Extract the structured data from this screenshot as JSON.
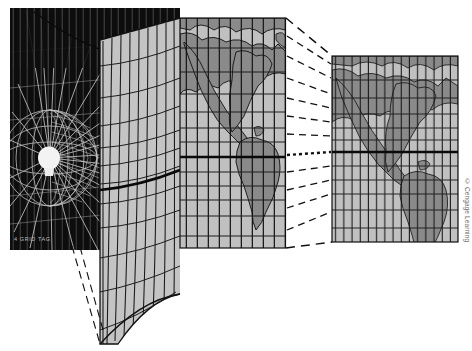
{
  "figure": {
    "credit": "© Cengage Learning",
    "globe_label": "4 GRID TAG",
    "colors": {
      "paper": "#ffffff",
      "globe_panel": "#111111",
      "cylinder_face": "#c4c4c4",
      "map_ocean": "#c0c0c0",
      "map_land": "#8a8a8a",
      "grid_line": "#1a1a1a",
      "light_ray": "#e8e8e8",
      "bulb": "#f2f2f2",
      "dashed_line": "#111111",
      "credit_text": "#6b6b6b"
    },
    "panels": [
      {
        "name": "globe-cylinder-panel",
        "label": "Globe with light source inside tangent cylinder",
        "x": 10,
        "y": 8,
        "width": 170,
        "height": 242
      },
      {
        "name": "unrolled-cylinder-panel",
        "label": "Cylinder unrolled to flat map",
        "x": 100,
        "y": 18,
        "width": 185,
        "height": 320
      },
      {
        "name": "reduced-map-panel",
        "label": "Reduced scale flat map",
        "x": 330,
        "y": 56,
        "width": 130,
        "height": 186
      }
    ],
    "graticule": {
      "meridian_count": 24,
      "parallel_count": 12,
      "equator_emphasis": true,
      "equator_y": 157
    },
    "elements": {
      "light_bulb": "light-bulb",
      "light_rays": "projection-rays",
      "equator_line": "equator",
      "dashed_projectors": "scale-reduction-lines"
    }
  }
}
